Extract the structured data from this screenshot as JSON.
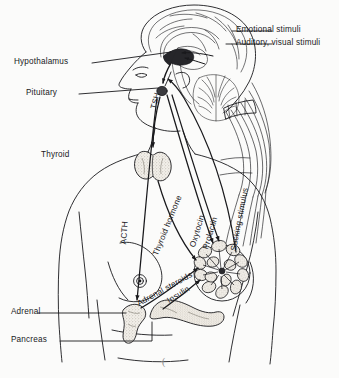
{
  "figure": {
    "background_color": "#fbfbfa",
    "ink_color": "#19191c"
  },
  "labels": {
    "hypothalamus": "Hypothalamus",
    "pituitary": "Pituitary",
    "thyroid": "Thyroid",
    "adrenal": "Adrenal",
    "pancreas": "Pancreas",
    "emotional_stimuli": "Emotional stimuli",
    "auditory_visual_stimuli": "Auditory, visual stimuli"
  },
  "pathways": {
    "tsh": "TSH",
    "acth": "ACTH",
    "thyroid_hormone": "Thyroid hormone",
    "oxytocin": "Oxytocin",
    "prolactin": "Prolactin",
    "sucking_stimulus": "Sucking stimulus",
    "adrenal_steroids": "Adrenal steroids",
    "insulin": "Insulin"
  },
  "marks": {
    "page_artifact": "("
  }
}
